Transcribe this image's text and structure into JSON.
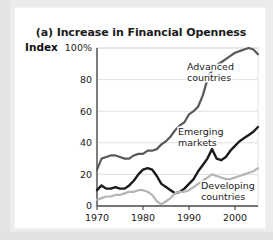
{
  "figure": {
    "panel_label": "(a)",
    "title": "(a) Increase in Financial Openness",
    "axis_name": "Index"
  },
  "colors": {
    "advanced": "#595959",
    "emerging": "#1a1a1a",
    "developing": "#b5b5b5",
    "grid": "#e0e0e0",
    "axis": "#4d4d4d",
    "card": "#ffffff",
    "frame": "#ebecec"
  },
  "labels": {
    "advanced_line1": "Advanced",
    "advanced_line2": "countries",
    "emerging_line1": "Emerging",
    "emerging_line2": "markets",
    "developing_line1": "Developing",
    "developing_line2": "countries"
  },
  "chart_data": {
    "type": "line",
    "title": "(a) Increase in Financial Openness",
    "xlabel": "",
    "ylabel": "Index",
    "ylim": [
      0,
      100
    ],
    "xlim": [
      1970,
      2005
    ],
    "yticks": [
      "0",
      "20",
      "40",
      "60",
      "80",
      "100%"
    ],
    "ytick_values": [
      0,
      20,
      40,
      60,
      80,
      100
    ],
    "xticks": [
      "1970",
      "1980",
      "1990",
      "2000"
    ],
    "xtick_values": [
      1970,
      1980,
      1990,
      2000
    ],
    "grid": "horizontal",
    "legend": "inline-annotations",
    "x": [
      1970,
      1971,
      1972,
      1973,
      1974,
      1975,
      1976,
      1977,
      1978,
      1979,
      1980,
      1981,
      1982,
      1983,
      1984,
      1985,
      1986,
      1987,
      1988,
      1989,
      1990,
      1991,
      1992,
      1993,
      1994,
      1995,
      1996,
      1997,
      1998,
      1999,
      2000,
      2001,
      2002,
      2003,
      2004,
      2005
    ],
    "series": [
      {
        "name": "Advanced countries",
        "color": "#595959",
        "values": [
          23,
          30,
          31,
          32,
          32,
          31,
          30,
          30,
          32,
          33,
          33,
          35,
          35,
          36,
          39,
          41,
          44,
          48,
          51,
          53,
          58,
          60,
          63,
          70,
          80,
          86,
          89,
          91,
          93,
          95,
          97,
          98,
          99,
          100,
          99,
          96
        ]
      },
      {
        "name": "Emerging markets",
        "color": "#1a1a1a",
        "values": [
          10,
          13,
          11,
          11,
          12,
          11,
          11,
          13,
          16,
          20,
          23,
          24,
          23,
          19,
          14,
          12,
          10,
          8,
          9,
          11,
          14,
          17,
          22,
          26,
          30,
          36,
          30,
          29,
          31,
          35,
          38,
          41,
          43,
          45,
          47,
          50
        ]
      },
      {
        "name": "Developing countries",
        "color": "#b5b5b5",
        "values": [
          4,
          5,
          6,
          6,
          7,
          7,
          8,
          9,
          9,
          10,
          10,
          9,
          7,
          3,
          1,
          3,
          5,
          8,
          9,
          9,
          10,
          12,
          14,
          16,
          18,
          20,
          19,
          18,
          17,
          17,
          18,
          19,
          20,
          21,
          22,
          24
        ]
      }
    ]
  }
}
